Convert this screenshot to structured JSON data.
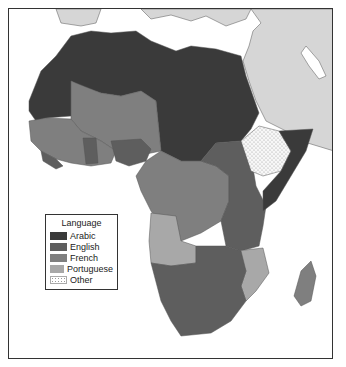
{
  "map": {
    "subject": "Official languages of Africa",
    "legend": {
      "title": "Language",
      "items": [
        {
          "label": "Arabic",
          "color": "#3a3a3a",
          "pattern": "solid"
        },
        {
          "label": "English",
          "color": "#5e5e5e",
          "pattern": "solid"
        },
        {
          "label": "French",
          "color": "#7f7f7f",
          "pattern": "solid"
        },
        {
          "label": "Portuguese",
          "color": "#a8a8a8",
          "pattern": "solid"
        },
        {
          "label": "Other",
          "color": "#ffffff",
          "pattern": "dotted"
        }
      ]
    },
    "colors": {
      "arabic": "#3a3a3a",
      "english": "#5e5e5e",
      "french": "#7f7f7f",
      "portuguese": "#a8a8a8",
      "other": "#f4f4f4",
      "non_africa_land": "#d6d6d6",
      "water": "#ffffff",
      "border": "#444444"
    }
  }
}
